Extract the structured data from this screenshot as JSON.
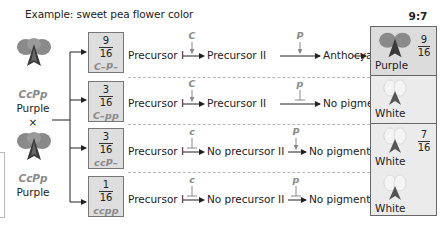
{
  "title": "Example: sweet pea flower color",
  "ratio": "9:7",
  "parents": [
    {
      "genotype": "CcPp",
      "phenotype": "Purple",
      "flower_color": "purple"
    },
    {
      "genotype": "CcPp",
      "phenotype": "Purple",
      "flower_color": "purple"
    }
  ],
  "cross_symbol": "×",
  "rows": [
    {
      "fraction_num": "9",
      "fraction_den": "16",
      "genotype": "C–P–",
      "step1_from": "Precursor I",
      "gene1": "C",
      "gene1_effect": "activates",
      "step1_to": "Precursor II",
      "gene2": "P",
      "gene2_effect": "activates",
      "step2_to": "Anthocyanin",
      "result": "Purple"
    },
    {
      "fraction_num": "3",
      "fraction_den": "16",
      "genotype": "C–pp",
      "step1_from": "Precursor I",
      "gene1": "C",
      "gene1_effect": "activates",
      "step1_to": "Precursor II",
      "gene2": "p",
      "gene2_effect": "blocks",
      "step2_to": "No pigment",
      "result": "White"
    },
    {
      "fraction_num": "3",
      "fraction_den": "16",
      "genotype": "ccP–",
      "step1_from": "Precursor I",
      "gene1": "c",
      "gene1_effect": "blocks",
      "step1_to": "No precursor II",
      "gene2": "P",
      "gene2_effect": "activates",
      "step2_to": "No pigment",
      "result": "White"
    },
    {
      "fraction_num": "1",
      "fraction_den": "16",
      "genotype": "ccpp",
      "step1_from": "Precursor I",
      "gene1": "c",
      "gene1_effect": "blocks",
      "step1_to": "No precursor II",
      "gene2": "p",
      "gene2_effect": "blocks",
      "step2_to": "No pigment",
      "result": "White"
    }
  ],
  "outcomes": {
    "purple": {
      "label": "Purple",
      "num": "9",
      "den": "16"
    },
    "white": {
      "label": "White",
      "num": "7",
      "den": "16"
    }
  },
  "colors": {
    "gene_text": "#8a8a8a",
    "box_fill": "#dedede",
    "box_border": "#777777",
    "dashed_separator": "#b8b8b8",
    "purple_flower": "#6a6a6a",
    "white_flower": "#e0e0e0"
  }
}
